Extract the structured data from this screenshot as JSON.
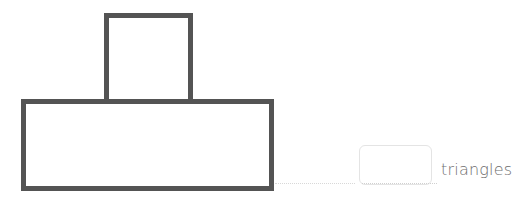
{
  "diagram": {
    "type": "composite-shape",
    "shapes": [
      {
        "name": "small-square",
        "shape": "square",
        "position": "top-center-left",
        "stroke": "#545454"
      },
      {
        "name": "big-rectangle",
        "shape": "rectangle",
        "position": "bottom",
        "stroke": "#545454"
      }
    ],
    "answer": {
      "input_value": "",
      "unit_label": "triangles"
    }
  }
}
